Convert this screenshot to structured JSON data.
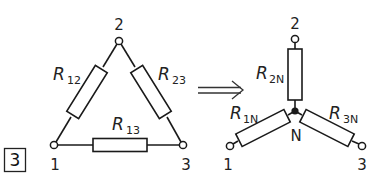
{
  "figure": {
    "number_label": "3",
    "arrow_symbol": "implies-arrow"
  },
  "delta": {
    "nodes": [
      {
        "id": "1",
        "label": "1"
      },
      {
        "id": "2",
        "label": "2"
      },
      {
        "id": "3",
        "label": "3"
      }
    ],
    "resistors": [
      {
        "name": "R12",
        "main": "R",
        "sub": "12"
      },
      {
        "name": "R23",
        "main": "R",
        "sub": "23"
      },
      {
        "name": "R13",
        "main": "R",
        "sub": "13"
      }
    ]
  },
  "star": {
    "nodes": [
      {
        "id": "1",
        "label": "1"
      },
      {
        "id": "2",
        "label": "2"
      },
      {
        "id": "3",
        "label": "3"
      }
    ],
    "center_label": "N",
    "resistors": [
      {
        "name": "R2N",
        "main": "R",
        "sub": "2N"
      },
      {
        "name": "R1N",
        "main": "R",
        "sub": "1N"
      },
      {
        "name": "R3N",
        "main": "R",
        "sub": "3N"
      }
    ]
  },
  "colors": {
    "line": "#1a1a1a",
    "background": "#ffffff"
  }
}
